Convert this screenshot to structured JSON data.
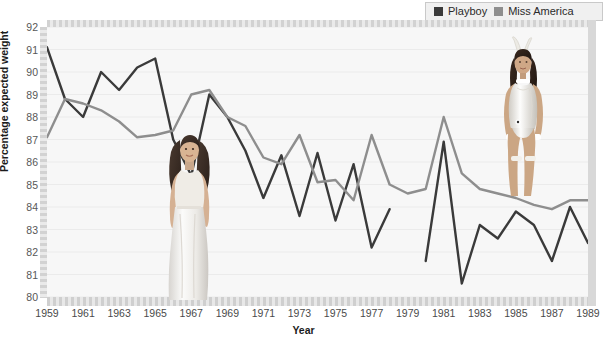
{
  "legend": {
    "position": "top-right",
    "items": [
      {
        "label": "Playboy",
        "color": "#3a3a3a",
        "swatch": "playboy-swatch"
      },
      {
        "label": "Miss America",
        "color": "#8e8e8e",
        "swatch": "miss-america-swatch"
      }
    ]
  },
  "chart_data": {
    "type": "line",
    "title": "",
    "xlabel": "Year",
    "ylabel": "Percentage expected weight",
    "xlim": [
      1959,
      1989
    ],
    "ylim": [
      80,
      92
    ],
    "yticks": [
      80,
      81,
      82,
      83,
      84,
      85,
      86,
      87,
      88,
      89,
      90,
      91,
      92
    ],
    "xticks": [
      1959,
      1961,
      1963,
      1965,
      1967,
      1969,
      1971,
      1973,
      1975,
      1977,
      1979,
      1981,
      1983,
      1985,
      1987,
      1989
    ],
    "grid": true,
    "x": [
      1959,
      1960,
      1961,
      1962,
      1963,
      1964,
      1965,
      1966,
      1967,
      1968,
      1969,
      1970,
      1971,
      1972,
      1973,
      1974,
      1975,
      1976,
      1977,
      1978,
      1979,
      1980,
      1981,
      1982,
      1983,
      1984,
      1985,
      1986,
      1987,
      1988,
      1989
    ],
    "series": [
      {
        "name": "Playboy",
        "color": "#3a3a3a",
        "values": [
          91.1,
          88.8,
          88.0,
          90.0,
          89.2,
          90.2,
          90.6,
          87.0,
          85.4,
          89.0,
          88.0,
          86.5,
          84.4,
          86.3,
          83.6,
          86.4,
          83.4,
          85.9,
          82.2,
          83.9,
          null,
          81.6,
          86.9,
          80.6,
          83.2,
          82.6,
          83.8,
          83.2,
          81.6,
          84.0,
          82.4
        ]
      },
      {
        "name": "Miss America",
        "color": "#8e8e8e",
        "values": [
          87.1,
          88.8,
          88.6,
          88.3,
          87.8,
          87.1,
          87.2,
          87.4,
          89.0,
          89.2,
          88.0,
          87.6,
          86.2,
          85.9,
          87.2,
          85.1,
          85.2,
          84.3,
          87.2,
          85.0,
          84.6,
          84.8,
          88.0,
          85.5,
          84.8,
          84.6,
          84.4,
          84.1,
          83.9,
          84.3,
          84.3
        ]
      }
    ]
  },
  "photos": [
    {
      "name": "miss-america-photo",
      "alt": "Miss America contestant in white gown"
    },
    {
      "name": "playboy-photo",
      "alt": "Playboy bunny model"
    }
  ]
}
